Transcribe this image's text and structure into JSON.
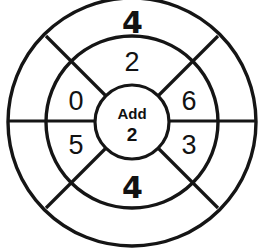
{
  "diagram": {
    "type": "concentric-wheel-worksheet",
    "background_color": "#ffffff",
    "stroke_color": "#151515",
    "text_color": "#121212",
    "center": {
      "x": 132,
      "y": 122
    },
    "radii": {
      "outer": 124,
      "middle": 86,
      "hub": 37
    },
    "hub": {
      "operation_label": "Add",
      "operand_value": "2"
    },
    "rings": {
      "middle": {
        "name": "input-ring",
        "segments": [
          {
            "position": "top",
            "angle_deg": 270,
            "value": "2",
            "style": "printed",
            "tx": 132,
            "ty": 62
          },
          {
            "position": "upper-left",
            "angle_deg": 202,
            "value": "0",
            "style": "printed",
            "tx": 76,
            "ty": 101
          },
          {
            "position": "upper-right",
            "angle_deg": 338,
            "value": "6",
            "style": "printed",
            "tx": 189,
            "ty": 101
          },
          {
            "position": "lower-left",
            "angle_deg": 158,
            "value": "5",
            "style": "printed",
            "tx": 76,
            "ty": 145
          },
          {
            "position": "lower-right",
            "angle_deg": 22,
            "value": "3",
            "style": "printed",
            "tx": 189,
            "ty": 145
          },
          {
            "position": "bottom",
            "angle_deg": 90,
            "value": "4",
            "style": "handwritten",
            "tx": 132,
            "ty": 187
          }
        ]
      },
      "outer": {
        "name": "answer-ring",
        "segments": [
          {
            "position": "top",
            "angle_deg": 270,
            "value": "4",
            "style": "handwritten",
            "tx": 132,
            "ty": 20
          },
          {
            "position": "upper-left",
            "angle_deg": 202,
            "value": "",
            "style": "blank",
            "tx": 40,
            "ty": 62
          },
          {
            "position": "upper-right",
            "angle_deg": 338,
            "value": "",
            "style": "blank",
            "tx": 224,
            "ty": 62
          },
          {
            "position": "lower-left",
            "angle_deg": 158,
            "value": "",
            "style": "blank",
            "tx": 40,
            "ty": 182
          },
          {
            "position": "lower-right",
            "angle_deg": 22,
            "value": "",
            "style": "blank",
            "tx": 224,
            "ty": 182
          },
          {
            "position": "bottom",
            "angle_deg": 90,
            "value": "",
            "style": "blank",
            "tx": 132,
            "ty": 226
          }
        ]
      }
    },
    "dividers": {
      "horizontal": {
        "y": 121,
        "x1": 8,
        "x2": 256
      },
      "diagonals": [
        {
          "name": "nw",
          "x1": 106,
          "y1": 96,
          "x2": 46,
          "y2": 36
        },
        {
          "name": "ne",
          "x1": 158,
          "y1": 96,
          "x2": 218,
          "y2": 36
        },
        {
          "name": "sw",
          "x1": 106,
          "y1": 148,
          "x2": 46,
          "y2": 208
        },
        {
          "name": "se",
          "x1": 158,
          "y1": 148,
          "x2": 218,
          "y2": 208
        }
      ]
    }
  }
}
